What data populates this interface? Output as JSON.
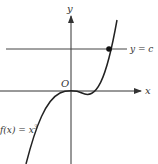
{
  "figure": {
    "function_label": "f(x) = x³",
    "function_label_base": "f(x) = x",
    "function_label_exp": "3",
    "line_label": "y = c",
    "x_axis_label": "x",
    "y_axis_label": "y",
    "origin_label": "O",
    "colors": {
      "axis": "#333333",
      "curve": "#222222",
      "line": "#444444",
      "point": "#111111"
    }
  }
}
